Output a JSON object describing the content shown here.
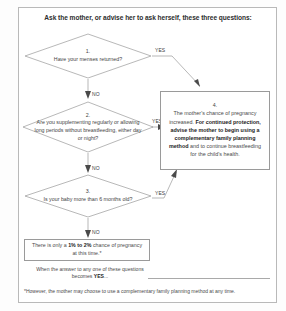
{
  "title": "Ask the mother, or advise her to ask herself, these three questions:",
  "decisions": [
    {
      "id": "q1",
      "number": "1.",
      "text": "Have your menses returned?",
      "yes_label": "YES",
      "no_label": "NO"
    },
    {
      "id": "q2",
      "number": "2.",
      "text": "Are you supplementing regularly or allowing long periods without breastfeeding, either day or night?",
      "yes_label": "YES",
      "no_label": "NO"
    },
    {
      "id": "q3",
      "number": "3.",
      "text": "Is your baby more than 6 months old?",
      "yes_label": "YES",
      "no_label": "NO"
    }
  ],
  "result_box": {
    "number": "4.",
    "line1": "The mother's chance of pregnancy increased. ",
    "bold1": "For continued protection, advise the mother to begin using a complementary family planning method",
    "line2": " and to continue breastfeeding for the child's health."
  },
  "low_risk_box": {
    "prefix": "There is only a ",
    "bold": "1% to 2%",
    "suffix": " chance of pregnancy at this time.*"
  },
  "bottom_note": {
    "prefix": "When the answer to any one of these questions becomes ",
    "bold": "YES",
    "suffix": "..."
  },
  "footnote": "*However, the mother may choose to use a complementary family planning method at any time.",
  "colors": {
    "stroke": "#9a9a9a",
    "text": "#444444",
    "bold_text": "#1d1d1d",
    "frame": "#b9b9b9"
  }
}
